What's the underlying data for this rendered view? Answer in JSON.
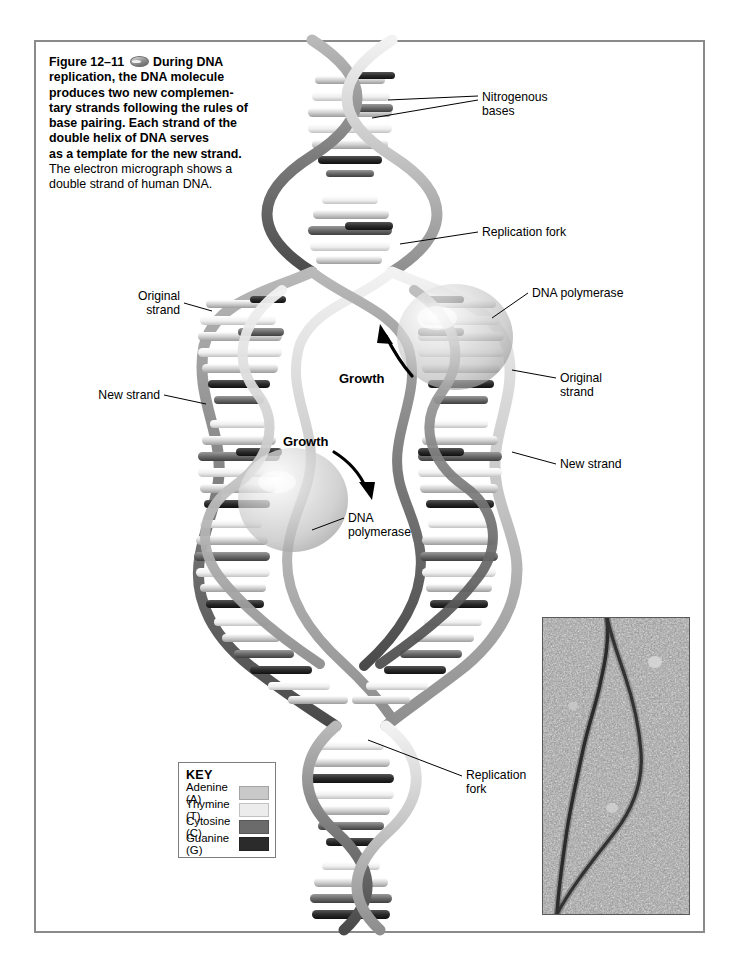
{
  "figure": {
    "number": "Figure 12–11",
    "icon": "oval-photo-icon",
    "caption_bold": "During DNA replication, the DNA molecule produces two new complementary strands following the rules of base pairing. Each strand of the double helix of DNA serves as a template for the new strand.",
    "caption_plain": "The electron micrograph shows a double strand of human DNA.",
    "caption_lines_bold": [
      "During DNA",
      "replication, the DNA molecule",
      "produces two new complemen-",
      "tary strands following the rules of",
      "base pairing. Each strand of the",
      "double helix of DNA serves",
      "as a template for the new strand."
    ],
    "caption_lines_plain": [
      "The electron micrograph shows a",
      "double strand of human DNA."
    ]
  },
  "labels": {
    "nitrogenous_bases": "Nitrogenous\nbases",
    "replication_fork_top": "Replication fork",
    "dna_polymerase_right": "DNA polymerase",
    "original_strand_right": "Original\nstrand",
    "new_strand_right": "New strand",
    "original_strand_left": "Original\nstrand",
    "new_strand_left": "New strand",
    "dna_polymerase_left": "DNA\npolymerase",
    "replication_fork_bottom": "Replication\nfork",
    "growth_upper": "Growth",
    "growth_lower": "Growth"
  },
  "key": {
    "title": "KEY",
    "items": [
      {
        "label": "Adenine (A)",
        "color": "#c9c9c9"
      },
      {
        "label": "Thymine (T)",
        "color": "#ececec"
      },
      {
        "label": "Cytosine (C)",
        "color": "#6b6b6b"
      },
      {
        "label": "Guanine (G)",
        "color": "#2b2b2b"
      }
    ]
  },
  "micrograph": {
    "name": "electron-micrograph-human-dna",
    "description": "Electron micrograph of a double strand of human DNA showing a replication bubble",
    "background": "#8f8f8f",
    "strand_color": "#1c1c1c"
  },
  "colors": {
    "page_border": "#8a8a8a",
    "text": "#000000",
    "backbone_light": "#d6d6d6",
    "backbone_dark": "#6e6e6e",
    "polymerase": "#c4c4c4"
  }
}
